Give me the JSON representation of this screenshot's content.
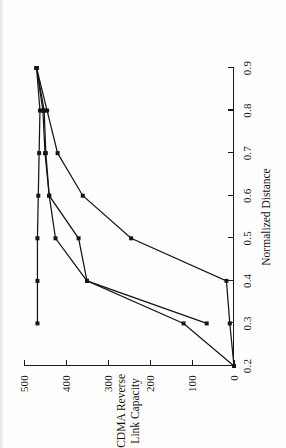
{
  "figure": {
    "orientation": "rotated-90-ccw",
    "background_color": "#fefefe",
    "ink_color": "#161616"
  },
  "chart_data": {
    "type": "line",
    "title": "",
    "xlabel": "Normalized Distance",
    "ylabel": "CDMA Reverse Link Capacity",
    "xlim": [
      0.2,
      0.9
    ],
    "ylim": [
      0,
      500
    ],
    "xticks": [
      0.2,
      0.3,
      0.4,
      0.5,
      0.6,
      0.7,
      0.8,
      0.9
    ],
    "xtick_labels": [
      "0.2",
      "0.3",
      "0.4",
      "0.5",
      "0.6",
      "0.7",
      "0.8",
      "0.9"
    ],
    "yticks": [
      0,
      100,
      200,
      300,
      400,
      500
    ],
    "ytick_labels": [
      "0",
      "100",
      "200",
      "300",
      "400",
      "500"
    ],
    "grid": false,
    "legend": null,
    "marker": "square",
    "series": [
      {
        "name": "curve-1-upper",
        "x": [
          0.3,
          0.4,
          0.5,
          0.6,
          0.7,
          0.8,
          0.9
        ],
        "values": [
          468,
          468,
          468,
          466,
          464,
          462,
          470
        ]
      },
      {
        "name": "curve-2-middle",
        "x": [
          0.3,
          0.4,
          0.5,
          0.6,
          0.7,
          0.8,
          0.9
        ],
        "values": [
          65,
          350,
          425,
          440,
          450,
          455,
          470
        ]
      },
      {
        "name": "curve-3-lower",
        "x": [
          0.2,
          0.3,
          0.4,
          0.5,
          0.6,
          0.7,
          0.8,
          0.9
        ],
        "values": [
          0,
          120,
          350,
          370,
          440,
          448,
          452,
          470
        ]
      },
      {
        "name": "curve-4-lowest",
        "x": [
          0.2,
          0.3,
          0.4,
          0.5,
          0.6,
          0.7,
          0.8,
          0.9
        ],
        "values": [
          0,
          10,
          18,
          245,
          360,
          420,
          445,
          470
        ]
      }
    ]
  }
}
